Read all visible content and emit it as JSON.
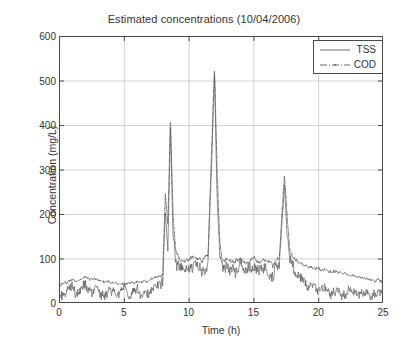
{
  "chart_data": {
    "type": "line",
    "title": "Estimated concentrations (10/04/2006)",
    "xlabel": "Time (h)",
    "ylabel": "Concentration (mg/L)",
    "xlim": [
      0,
      25
    ],
    "ylim": [
      0,
      600
    ],
    "xticks": [
      0,
      5,
      10,
      15,
      20,
      25
    ],
    "yticks": [
      0,
      100,
      200,
      300,
      400,
      500,
      600
    ],
    "grid": true,
    "legend_position": "top-right",
    "legend": [
      "TSS",
      "COD"
    ],
    "series": [
      {
        "name": "TSS",
        "style": "solid",
        "color": "#555555",
        "description": "Noisy solid trace; baseline 10-45 mg/L for 0-8 h, rises to 60-110 mg/L band between 8-18 h with sharp spikes, decays to 5-40 mg/L after 19 h",
        "x": [
          0.0,
          0.5,
          1.0,
          1.5,
          2.0,
          2.5,
          3.0,
          3.5,
          4.0,
          4.5,
          5.0,
          5.5,
          6.0,
          6.5,
          7.0,
          7.5,
          8.0,
          8.2,
          8.4,
          8.6,
          8.8,
          9.0,
          9.5,
          10.0,
          10.5,
          11.0,
          11.5,
          12.0,
          12.2,
          12.4,
          12.6,
          13.0,
          13.5,
          14.0,
          14.5,
          15.0,
          15.5,
          16.0,
          16.5,
          17.0,
          17.4,
          17.6,
          17.8,
          18.0,
          18.5,
          19.0,
          19.5,
          20.0,
          20.5,
          21.0,
          21.5,
          22.0,
          22.5,
          23.0,
          23.5,
          24.0,
          24.5
        ],
        "y": [
          14,
          22,
          31,
          18,
          40,
          25,
          33,
          17,
          28,
          20,
          35,
          21,
          30,
          16,
          27,
          36,
          48,
          205,
          120,
          392,
          150,
          95,
          72,
          78,
          88,
          70,
          92,
          505,
          240,
          110,
          85,
          78,
          70,
          84,
          66,
          88,
          72,
          80,
          64,
          90,
          268,
          150,
          96,
          78,
          58,
          46,
          35,
          28,
          40,
          22,
          33,
          18,
          30,
          14,
          26,
          12,
          24
        ]
      },
      {
        "name": "COD",
        "style": "dash-dot",
        "color": "#555555",
        "marker": "dot",
        "description": "Smoother dash-dot trace sitting above TSS; baseline 40-62 mg/L for 0-8 h, 75-105 mg/L plateau 9-17 h, sharp spikes coincide with TSS, declines from 85 to 50 mg/L over 18-25 h",
        "x": [
          0.0,
          0.5,
          1.0,
          1.5,
          2.0,
          2.5,
          3.0,
          3.5,
          4.0,
          4.5,
          5.0,
          5.5,
          6.0,
          6.5,
          7.0,
          7.5,
          8.0,
          8.2,
          8.4,
          8.6,
          8.8,
          9.0,
          9.5,
          10.0,
          10.5,
          11.0,
          11.5,
          12.0,
          12.2,
          12.4,
          12.6,
          13.0,
          13.5,
          14.0,
          14.5,
          15.0,
          15.5,
          16.0,
          16.5,
          17.0,
          17.4,
          17.6,
          17.8,
          18.0,
          18.5,
          19.0,
          19.5,
          20.0,
          20.5,
          21.0,
          21.5,
          22.0,
          22.5,
          23.0,
          23.5,
          24.0,
          24.5
        ],
        "y": [
          40,
          46,
          52,
          50,
          58,
          55,
          52,
          48,
          46,
          44,
          42,
          44,
          46,
          48,
          52,
          58,
          64,
          245,
          175,
          415,
          196,
          120,
          92,
          96,
          104,
          96,
          108,
          530,
          300,
          140,
          100,
          96,
          90,
          100,
          88,
          98,
          92,
          96,
          86,
          102,
          292,
          190,
          124,
          104,
          92,
          84,
          80,
          76,
          74,
          72,
          70,
          66,
          62,
          60,
          56,
          52,
          50
        ]
      }
    ],
    "annotations": [
      {
        "label": "peak-1",
        "x": 8.6,
        "value": 415
      },
      {
        "label": "peak-2",
        "x": 12.0,
        "value": 530
      },
      {
        "label": "peak-3",
        "x": 17.4,
        "value": 292
      }
    ]
  },
  "axes": {
    "y_tick_labels": [
      "600",
      "500",
      "400",
      "300",
      "200",
      "100",
      "0"
    ],
    "x_tick_labels": [
      "0",
      "5",
      "10",
      "15",
      "20",
      "25"
    ]
  }
}
